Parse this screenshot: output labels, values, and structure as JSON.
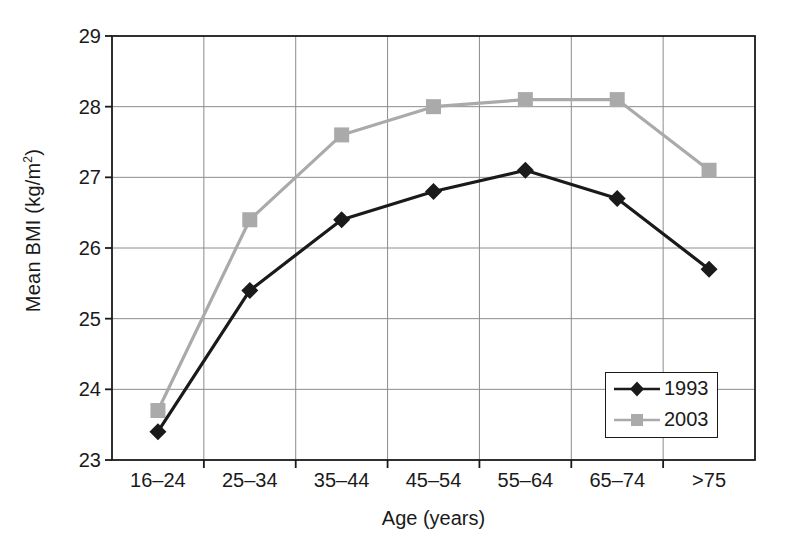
{
  "chart_data": {
    "type": "line",
    "title": "",
    "xlabel": "Age (years)",
    "ylabel": "Mean BMI (kg/m",
    "ylabel_sup": "2",
    "ylabel_tail": ")",
    "ylabel_full": "Mean BMI (kg/m2)",
    "categories": [
      "16–24",
      "25–34",
      "35–44",
      "45–54",
      "55–64",
      "65–74",
      ">75"
    ],
    "ylim": [
      23,
      29
    ],
    "yticks": [
      23,
      24,
      25,
      26,
      27,
      28,
      29
    ],
    "ytick_labels": [
      "23",
      "24",
      "25",
      "26",
      "27",
      "28",
      "29"
    ],
    "grid": "horizontal-and-vertical",
    "legend_position": "bottom-right-inside",
    "series": [
      {
        "name": "1993",
        "color": "#1a1a1a",
        "marker": "diamond",
        "values": [
          23.4,
          25.4,
          26.4,
          26.8,
          27.1,
          26.7,
          25.7
        ]
      },
      {
        "name": "2003",
        "color": "#aaaaaa",
        "marker": "square",
        "values": [
          23.7,
          26.4,
          27.6,
          28.0,
          28.1,
          28.1,
          27.1
        ]
      }
    ]
  },
  "legend": {
    "entries": [
      {
        "label": "1993"
      },
      {
        "label": "2003"
      }
    ]
  },
  "colors": {
    "series_1993": "#1a1a1a",
    "series_2003": "#aaaaaa",
    "grid": "#8c8c8c",
    "axis": "#1a1a1a",
    "background": "#ffffff"
  }
}
